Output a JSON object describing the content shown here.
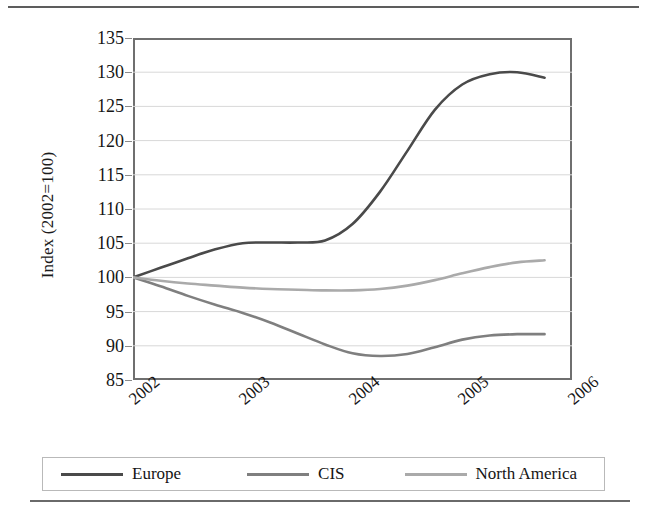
{
  "chart_data": {
    "type": "line",
    "title": "",
    "xlabel": "",
    "ylabel": "Index (2002=100)",
    "ylim": [
      85,
      135
    ],
    "xlim": [
      2002,
      2006
    ],
    "grid": true,
    "legend_position": "bottom",
    "y_ticks": [
      135,
      130,
      125,
      120,
      115,
      110,
      105,
      100,
      95,
      90,
      85
    ],
    "x_ticks": [
      "2002",
      "2003",
      "2004",
      "2005",
      "2006"
    ],
    "x": [
      2002,
      2002.25,
      2002.5,
      2002.75,
      2003,
      2003.25,
      2003.5,
      2003.75,
      2004,
      2004.25,
      2004.5,
      2004.75,
      2005,
      2005.25,
      2005.5,
      2005.75
    ],
    "series": [
      {
        "name": "Europe",
        "color": "#4a4a4a",
        "values": [
          100,
          101.4,
          102.8,
          104.1,
          105,
          105.1,
          105.1,
          105.4,
          107.8,
          112.5,
          118.5,
          124.5,
          128.2,
          129.7,
          130,
          129.2
        ]
      },
      {
        "name": "CIS",
        "color": "#7f7f7f",
        "values": [
          100,
          98.7,
          97.3,
          96.0,
          94.8,
          93.4,
          91.8,
          90.2,
          88.9,
          88.5,
          88.8,
          89.8,
          90.9,
          91.5,
          91.7,
          91.7
        ]
      },
      {
        "name": "North America",
        "color": "#aaaaaa",
        "values": [
          100,
          99.5,
          99.1,
          98.8,
          98.5,
          98.3,
          98.2,
          98.1,
          98.1,
          98.3,
          98.8,
          99.6,
          100.6,
          101.5,
          102.2,
          102.5
        ]
      }
    ]
  },
  "legend": {
    "items": [
      {
        "label": "Europe",
        "color": "#4a4a4a"
      },
      {
        "label": "CIS",
        "color": "#7f7f7f"
      },
      {
        "label": "North America",
        "color": "#aaaaaa"
      }
    ]
  }
}
